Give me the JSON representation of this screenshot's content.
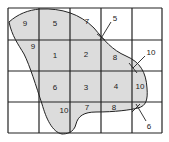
{
  "diagram": {
    "type": "grid-area-estimation",
    "grid": {
      "columns": 5,
      "rows": 4
    },
    "shape_fill": "#dcdcdc",
    "line_color": "#222222",
    "cell_labels": [
      {
        "id": "r0c0",
        "text": "9",
        "x": 25,
        "y": 26
      },
      {
        "id": "r0c1",
        "text": "5",
        "x": 55,
        "y": 26
      },
      {
        "id": "r0c2",
        "text": "7",
        "x": 87,
        "y": 24
      },
      {
        "id": "r1c0",
        "text": "9",
        "x": 32,
        "y": 49
      },
      {
        "id": "r1c1",
        "text": "1",
        "x": 55,
        "y": 57
      },
      {
        "id": "r1c2",
        "text": "2",
        "x": 86,
        "y": 56
      },
      {
        "id": "r1c3",
        "text": "8",
        "x": 114,
        "y": 60
      },
      {
        "id": "r2c1",
        "text": "6",
        "x": 55,
        "y": 89
      },
      {
        "id": "r2c2",
        "text": "3",
        "x": 86,
        "y": 89
      },
      {
        "id": "r2c3",
        "text": "4",
        "x": 116,
        "y": 89
      },
      {
        "id": "r2c4",
        "text": "10",
        "x": 137,
        "y": 88
      },
      {
        "id": "r3c1",
        "text": "10",
        "x": 64,
        "y": 113
      },
      {
        "id": "r3c2",
        "text": "7",
        "x": 87,
        "y": 110
      },
      {
        "id": "r3c3",
        "text": "8",
        "x": 114,
        "y": 110
      }
    ],
    "callouts": [
      {
        "id": "callout-top",
        "text": "5",
        "x": 113,
        "y": 20
      },
      {
        "id": "callout-right",
        "text": "10",
        "x": 146,
        "y": 54
      },
      {
        "id": "callout-bottom",
        "text": "6",
        "x": 148,
        "y": 129
      }
    ]
  }
}
